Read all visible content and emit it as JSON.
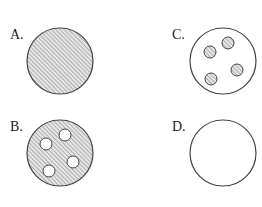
{
  "options": [
    {
      "id": "A",
      "label": "A.",
      "fill": "hatched",
      "inner_circles": "none",
      "label_pos": [
        10,
        27
      ],
      "center": [
        60,
        61
      ]
    },
    {
      "id": "B",
      "label": "B.",
      "fill": "hatched",
      "inner_circles": "four white holes",
      "label_pos": [
        10,
        119
      ],
      "center": [
        60,
        153
      ]
    },
    {
      "id": "C",
      "label": "C.",
      "fill": "white",
      "inner_circles": "four hatched circles",
      "label_pos": [
        172,
        27
      ],
      "center": [
        223,
        61
      ]
    },
    {
      "id": "D",
      "label": "D.",
      "fill": "white",
      "inner_circles": "none",
      "label_pos": [
        172,
        119
      ],
      "center": [
        223,
        153
      ]
    }
  ],
  "colors": {
    "stroke": "#444444",
    "hatch": "#8a8a8a",
    "background": "#ffffff"
  }
}
